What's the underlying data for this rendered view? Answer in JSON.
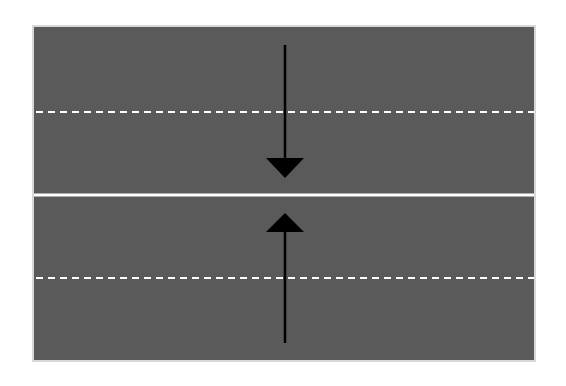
{
  "diagram": {
    "type": "road-lanes-head-on",
    "colors": {
      "background": "#ffffff",
      "road": "#5a5a5a",
      "road_border": "#d8d8d8",
      "lane_marking": "#ffffff",
      "arrow": "#000000"
    },
    "lanes": [
      {
        "name": "upper-lane-outer",
        "direction": "none"
      },
      {
        "name": "upper-lane-inner",
        "direction": "down"
      },
      {
        "name": "lower-lane-inner",
        "direction": "up"
      },
      {
        "name": "lower-lane-outer",
        "direction": "none"
      }
    ],
    "markings": [
      {
        "name": "upper-dashed-line",
        "style": "dashed",
        "y": 112
      },
      {
        "name": "center-solid-line",
        "style": "solid",
        "y": 195
      },
      {
        "name": "lower-dashed-line",
        "style": "dashed",
        "y": 278
      }
    ],
    "arrows": [
      {
        "name": "southbound-arrow",
        "x": 285,
        "y_start": 45,
        "y_end": 178,
        "direction": "down"
      },
      {
        "name": "northbound-arrow",
        "x": 285,
        "y_start": 343,
        "y_end": 213,
        "direction": "up"
      }
    ]
  }
}
